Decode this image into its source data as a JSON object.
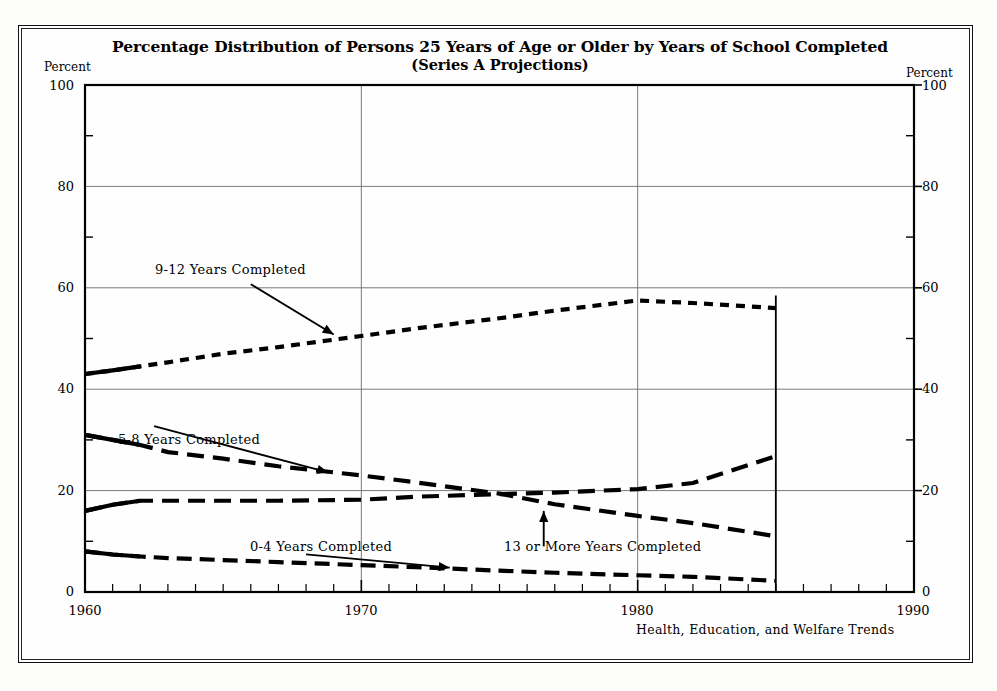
{
  "figure": {
    "title_line1": "Percentage Distribution of Persons 25 Years of Age or Older by Years of School Completed",
    "title_line2": "(Series A Projections)",
    "axis_caption_left": "Percent",
    "axis_caption_right": "Percent",
    "source_note": "Health, Education, and Welfare Trends",
    "ink_color": "#000000",
    "grid_color": "#7a7a7a",
    "background_color": "#fefefe"
  },
  "chart_data": {
    "type": "line",
    "title": "Percentage Distribution of Persons 25 Years of Age or Older by Years of School Completed (Series A Projections)",
    "subtitle": "(Series A Projections)",
    "xlabel": "",
    "ylabel": "Percent",
    "xlim": [
      1960,
      1990
    ],
    "ylim": [
      0,
      100
    ],
    "xticks": [
      1960,
      1970,
      1980,
      1990
    ],
    "xtick_labels": [
      "1960",
      "1970",
      "1980",
      "1990"
    ],
    "yticks": [
      0,
      20,
      40,
      60,
      80,
      100
    ],
    "ytick_labels": [
      "0",
      "20",
      "40",
      "60",
      "80",
      "100"
    ],
    "minor_xtick_interval": 1,
    "grid": true,
    "grid_axis": "both-major",
    "legend": "inline-annotations",
    "data_end_year": 1985,
    "series": [
      {
        "name": "9-12 Years Completed",
        "label": "9-12 Years Completed",
        "dash": "short-dash",
        "x": [
          1960,
          1961,
          1962,
          1963,
          1965,
          1967,
          1970,
          1972,
          1975,
          1977,
          1980,
          1982,
          1985
        ],
        "values": [
          43.0,
          43.7,
          44.5,
          45.3,
          47.0,
          48.3,
          50.5,
          52.0,
          54.0,
          55.5,
          57.5,
          57.0,
          56.0
        ]
      },
      {
        "name": "5-8 Years Completed",
        "label": "5-8 Years Completed",
        "dash": "long-dash",
        "x": [
          1960,
          1961,
          1962,
          1963,
          1965,
          1967,
          1970,
          1972,
          1975,
          1977,
          1980,
          1982,
          1985
        ],
        "values": [
          31.0,
          30.0,
          29.0,
          27.6,
          26.3,
          24.8,
          23.0,
          21.6,
          19.4,
          17.3,
          15.0,
          13.6,
          11.0
        ]
      },
      {
        "name": "13 or More Years Completed",
        "label": "13 or More Years Completed",
        "dash": "long-dash",
        "x": [
          1960,
          1961,
          1962,
          1963,
          1965,
          1967,
          1970,
          1972,
          1975,
          1977,
          1980,
          1982,
          1985
        ],
        "values": [
          16.0,
          17.2,
          18.0,
          18.0,
          18.0,
          18.0,
          18.2,
          18.8,
          19.3,
          19.6,
          20.3,
          21.5,
          26.8
        ]
      },
      {
        "name": "0-4 Years Completed",
        "label": "0-4 Years Completed",
        "dash": "dash-dot",
        "x": [
          1960,
          1961,
          1962,
          1963,
          1965,
          1967,
          1970,
          1972,
          1975,
          1977,
          1980,
          1982,
          1985
        ],
        "values": [
          8.0,
          7.4,
          7.0,
          6.7,
          6.3,
          5.9,
          5.3,
          4.9,
          4.2,
          3.8,
          3.3,
          3.0,
          2.2
        ]
      }
    ],
    "annotations": [
      {
        "text": "9-12 Years Completed",
        "x": 1966.0,
        "y": 61.5,
        "arrow_to_x": 1969.0,
        "arrow_to_y": 50.8
      },
      {
        "text": "5-8 Years Completed",
        "x": 1962.5,
        "y": 33.5,
        "arrow_to_x": 1968.8,
        "arrow_to_y": 23.6
      },
      {
        "text": "0-4 Years Completed",
        "x": 1968.0,
        "y": 8.2,
        "arrow_to_x": 1973.2,
        "arrow_to_y": 4.8
      },
      {
        "text": "13 or More Years Completed",
        "x": 1976.6,
        "y": 8.2,
        "arrow_to_x": 1976.6,
        "arrow_to_y": 16.0
      }
    ]
  },
  "ticks": {
    "y_left": [
      {
        "label": "100",
        "value": 100
      },
      {
        "label": "80",
        "value": 80
      },
      {
        "label": "60",
        "value": 60
      },
      {
        "label": "40",
        "value": 40
      },
      {
        "label": "20",
        "value": 20
      },
      {
        "label": "0",
        "value": 0
      }
    ],
    "y_right": [
      {
        "label": "100",
        "value": 100
      },
      {
        "label": "80",
        "value": 80
      },
      {
        "label": "60",
        "value": 60
      },
      {
        "label": "40",
        "value": 40
      },
      {
        "label": "20",
        "value": 20
      },
      {
        "label": "0",
        "value": 0
      }
    ],
    "x": [
      {
        "label": "1960",
        "value": 1960
      },
      {
        "label": "1970",
        "value": 1970
      },
      {
        "label": "1980",
        "value": 1980
      },
      {
        "label": "1990",
        "value": 1990
      }
    ]
  }
}
